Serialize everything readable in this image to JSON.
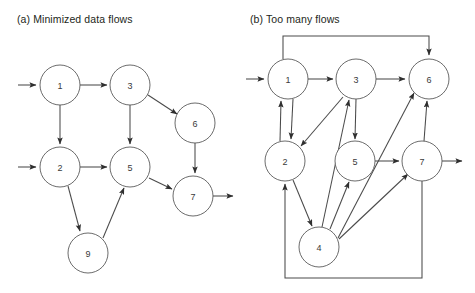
{
  "figure": {
    "width": 475,
    "height": 293,
    "background_color": "#ffffff",
    "stroke_color": "#4a4a4a",
    "node_stroke_color": "#5a5a5a",
    "node_fill_color": "#ffffff",
    "text_color": "#231f20",
    "node_radius": 20
  },
  "panels": [
    {
      "id": "panel-a",
      "caption": "(a) Minimized data flows",
      "nodes": [
        {
          "id": "a1",
          "label": "1",
          "cx": 60,
          "cy": 85,
          "r": 20
        },
        {
          "id": "a3",
          "label": "3",
          "cx": 130,
          "cy": 85,
          "r": 20
        },
        {
          "id": "a6",
          "label": "6",
          "cx": 195,
          "cy": 123,
          "r": 20
        },
        {
          "id": "a2",
          "label": "2",
          "cx": 60,
          "cy": 167,
          "r": 20
        },
        {
          "id": "a5",
          "label": "5",
          "cx": 130,
          "cy": 167,
          "r": 20
        },
        {
          "id": "a7",
          "label": "7",
          "cx": 193,
          "cy": 196,
          "r": 20
        },
        {
          "id": "a9",
          "label": "9",
          "cx": 88,
          "cy": 253,
          "r": 20
        }
      ],
      "edges": [
        {
          "from": "input",
          "to": "a1",
          "path": "M 18 85 L 36 85"
        },
        {
          "from": "a1",
          "to": "a3",
          "path": "M 80 85 L 107 85"
        },
        {
          "from": "a3",
          "to": "a6",
          "path": "M 148 95 L 177 114"
        },
        {
          "from": "a1",
          "to": "a2",
          "path": "M 60 105 L 60 144"
        },
        {
          "from": "a3",
          "to": "a5",
          "path": "M 130 105 L 130 144"
        },
        {
          "from": "input",
          "to": "a2",
          "path": "M 18 167 L 36 167"
        },
        {
          "from": "a2",
          "to": "a5",
          "path": "M 80 167 L 107 167"
        },
        {
          "from": "a6",
          "to": "a7",
          "path": "M 195 143 L 195 173"
        },
        {
          "from": "a5",
          "to": "a7",
          "path": "M 149 178 L 172 189"
        },
        {
          "from": "a2",
          "to": "a9",
          "path": "M 68 186 L 80 231"
        },
        {
          "from": "a9",
          "to": "a5",
          "path": "M 103 238 L 124 188"
        },
        {
          "from": "a7",
          "to": "output",
          "path": "M 213 196 L 233 196"
        }
      ]
    },
    {
      "id": "panel-b",
      "caption": "(b) Too many flows",
      "nodes": [
        {
          "id": "b1",
          "label": "1",
          "cx": 288,
          "cy": 79,
          "r": 20
        },
        {
          "id": "b3",
          "label": "3",
          "cx": 356,
          "cy": 79,
          "r": 20
        },
        {
          "id": "b6",
          "label": "6",
          "cx": 429,
          "cy": 79,
          "r": 20
        },
        {
          "id": "b2",
          "label": "2",
          "cx": 285,
          "cy": 161,
          "r": 20
        },
        {
          "id": "b5",
          "label": "5",
          "cx": 355,
          "cy": 161,
          "r": 20
        },
        {
          "id": "b7",
          "label": "7",
          "cx": 422,
          "cy": 161,
          "r": 20
        },
        {
          "id": "b4",
          "label": "4",
          "cx": 319,
          "cy": 247,
          "r": 20
        }
      ],
      "edges": [
        {
          "from": "input",
          "to": "b1",
          "path": "M 246 79 L 264 79"
        },
        {
          "from": "b1",
          "to": "b3",
          "path": "M 308 79 L 333 79"
        },
        {
          "from": "b3",
          "to": "b6",
          "path": "M 376 79 L 405 79"
        },
        {
          "from": "b1",
          "to": "b6",
          "path": "M 283 59 L 283 36 L 429 36 L 429 55"
        },
        {
          "from": "b1",
          "to": "b2",
          "path": "M 293 99 L 291 139"
        },
        {
          "from": "b2",
          "to": "b1",
          "path": "M 280 141 L 281 101"
        },
        {
          "from": "b3",
          "to": "b2",
          "path": "M 343 97 L 301 146"
        },
        {
          "from": "b3",
          "to": "b5",
          "path": "M 356 99 L 355 139"
        },
        {
          "from": "b4",
          "to": "b3",
          "path": "M 322 227 L 349 100"
        },
        {
          "from": "b2",
          "to": "b4",
          "path": "M 293 180 L 312 226"
        },
        {
          "from": "b4",
          "to": "b5",
          "path": "M 330 229 L 349 182"
        },
        {
          "from": "b4",
          "to": "b6",
          "path": "M 338 238 L 414 93"
        },
        {
          "from": "b4",
          "to": "b7",
          "path": "M 339 239 L 408 174"
        },
        {
          "from": "b5",
          "to": "b7",
          "path": "M 375 161 L 399 161"
        },
        {
          "from": "b7",
          "to": "b6",
          "path": "M 424 141 L 427 101"
        },
        {
          "from": "b7",
          "to": "b2",
          "path": "M 422 181 L 422 278 L 285 278 L 285 184"
        },
        {
          "from": "b7",
          "to": "output",
          "path": "M 442 161 L 462 161"
        }
      ]
    }
  ]
}
